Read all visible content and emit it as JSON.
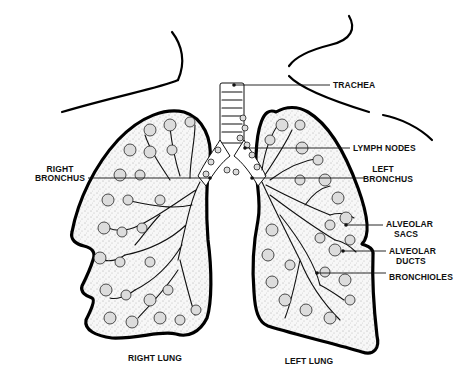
{
  "diagram": {
    "labels": {
      "trachea": "TRACHEA",
      "lymph_nodes": "LYMPH NODES",
      "left_bronchus_line1": "LEFT",
      "left_bronchus_line2": "BRONCHUS",
      "right_bronchus_line1": "RIGHT",
      "right_bronchus_line2": "BRONCHUS",
      "alveolar_sacs_line1": "ALVEOLAR",
      "alveolar_sacs_line2": "SACS",
      "alveolar_ducts_line1": "ALVEOLAR",
      "alveolar_ducts_line2": "DUCTS",
      "bronchioles": "BRONCHIOLES",
      "right_lung": "RIGHT LUNG",
      "left_lung": "LEFT LUNG"
    },
    "colors": {
      "ink": "#111111",
      "background": "#ffffff",
      "alveoli_fill": "#dcdcdc"
    }
  }
}
